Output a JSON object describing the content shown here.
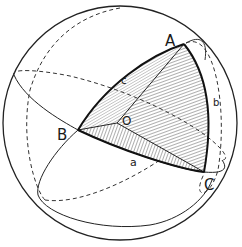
{
  "diagram": {
    "type": "spherical-triangle",
    "vertices": {
      "A": "A",
      "B": "B",
      "C": "C",
      "O": "O"
    },
    "sides": {
      "a": "a",
      "b": "b",
      "c": "c"
    }
  }
}
